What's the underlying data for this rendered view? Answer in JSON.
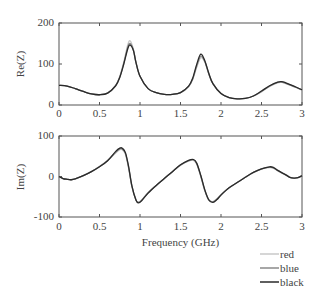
{
  "chart_data": [
    {
      "type": "line",
      "title": "",
      "xlabel": "",
      "ylabel": "Re(Z)",
      "xlim": [
        0,
        3
      ],
      "ylim": [
        0,
        200
      ],
      "xticks": [
        "0",
        "0.5",
        "1",
        "1.5",
        "2",
        "2.5",
        "3"
      ],
      "yticks": [
        "0",
        "100",
        "200"
      ],
      "grid": false,
      "x": [
        0,
        0.1,
        0.2,
        0.3,
        0.4,
        0.5,
        0.6,
        0.7,
        0.75,
        0.8,
        0.85,
        0.88,
        0.92,
        0.95,
        1.0,
        1.1,
        1.2,
        1.3,
        1.4,
        1.5,
        1.6,
        1.65,
        1.7,
        1.75,
        1.8,
        1.85,
        1.9,
        2.0,
        2.1,
        2.2,
        2.3,
        2.4,
        2.5,
        2.6,
        2.7,
        2.75,
        2.8,
        2.9,
        3.0
      ],
      "series": [
        {
          "name": "red",
          "values": [
            48,
            46,
            40,
            33,
            27,
            25,
            29,
            48,
            70,
            105,
            148,
            156,
            135,
            105,
            70,
            40,
            30,
            26,
            26,
            30,
            45,
            62,
            92,
            115,
            105,
            75,
            52,
            28,
            18,
            15,
            16,
            22,
            32,
            45,
            54,
            55,
            52,
            45,
            36
          ]
        },
        {
          "name": "blue",
          "values": [
            48,
            46,
            40,
            33,
            27,
            25,
            29,
            47,
            68,
            102,
            142,
            150,
            133,
            104,
            70,
            40,
            30,
            26,
            26,
            30,
            45,
            63,
            95,
            119,
            106,
            76,
            52,
            28,
            18,
            15,
            16,
            22,
            33,
            46,
            55,
            56,
            53,
            45,
            37
          ]
        },
        {
          "name": "black",
          "values": [
            48,
            46,
            40,
            33,
            27,
            25,
            29,
            47,
            67,
            100,
            138,
            146,
            132,
            104,
            70,
            40,
            30,
            26,
            26,
            30,
            46,
            65,
            99,
            124,
            108,
            77,
            52,
            28,
            18,
            15,
            16,
            22,
            34,
            47,
            56,
            57,
            54,
            46,
            37
          ]
        }
      ]
    },
    {
      "type": "line",
      "title": "",
      "xlabel": "Frequency (GHz)",
      "ylabel": "Im(Z)",
      "xlim": [
        0,
        3
      ],
      "ylim": [
        -100,
        100
      ],
      "xticks": [
        "0",
        "0.5",
        "1",
        "1.5",
        "2",
        "2.5",
        "3"
      ],
      "yticks": [
        "-100",
        "0",
        "100"
      ],
      "grid": false,
      "x": [
        0,
        0.05,
        0.1,
        0.15,
        0.2,
        0.3,
        0.4,
        0.5,
        0.6,
        0.7,
        0.75,
        0.78,
        0.82,
        0.86,
        0.9,
        0.95,
        0.98,
        1.02,
        1.1,
        1.2,
        1.3,
        1.4,
        1.5,
        1.6,
        1.66,
        1.7,
        1.75,
        1.8,
        1.85,
        1.9,
        1.95,
        2.0,
        2.1,
        2.2,
        2.3,
        2.4,
        2.5,
        2.6,
        2.65,
        2.7,
        2.8,
        2.85,
        2.9,
        2.95,
        3.0
      ],
      "series": [
        {
          "name": "red",
          "values": [
            0,
            -5,
            -7,
            -8,
            -6,
            2,
            12,
            25,
            40,
            58,
            66,
            66,
            55,
            20,
            -25,
            -58,
            -63,
            -58,
            -40,
            -22,
            -5,
            12,
            28,
            38,
            40,
            30,
            0,
            -35,
            -58,
            -62,
            -55,
            -45,
            -28,
            -15,
            -2,
            10,
            18,
            22,
            20,
            14,
            3,
            -2,
            -4,
            -3,
            2
          ]
        },
        {
          "name": "blue",
          "values": [
            0,
            -5,
            -7,
            -8,
            -6,
            2,
            12,
            24,
            39,
            60,
            68,
            68,
            57,
            22,
            -24,
            -58,
            -64,
            -59,
            -40,
            -22,
            -5,
            12,
            28,
            39,
            41,
            32,
            2,
            -34,
            -58,
            -63,
            -56,
            -45,
            -28,
            -15,
            -2,
            10,
            19,
            23,
            21,
            15,
            4,
            -2,
            -4,
            -3,
            2
          ]
        },
        {
          "name": "black",
          "values": [
            0,
            -5,
            -7,
            -8,
            -6,
            2,
            12,
            24,
            39,
            62,
            70,
            70,
            59,
            24,
            -23,
            -58,
            -65,
            -60,
            -41,
            -22,
            -5,
            12,
            29,
            40,
            42,
            33,
            3,
            -33,
            -58,
            -64,
            -57,
            -46,
            -28,
            -15,
            -2,
            10,
            19,
            24,
            22,
            15,
            4,
            -2,
            -4,
            -3,
            2
          ]
        }
      ]
    }
  ],
  "legend": {
    "position": "bottom-right",
    "items": [
      {
        "label": "red",
        "color": "#c8c8c8"
      },
      {
        "label": "blue",
        "color": "#8a8a8a"
      },
      {
        "label": "black",
        "color": "#2a2a2a"
      }
    ]
  },
  "colors": {
    "red": "#c8c8c8",
    "blue": "#8a8a8a",
    "black": "#2a2a2a",
    "axes": "#555555"
  }
}
